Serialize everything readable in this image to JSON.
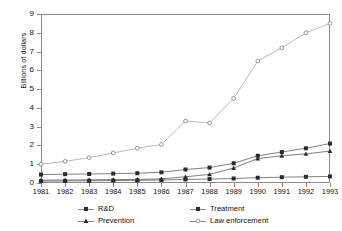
{
  "chart_data": {
    "type": "line",
    "title": "",
    "xlabel": "",
    "ylabel": "Billions of dollars",
    "categories": [
      "1981",
      "1982",
      "1983",
      "1984",
      "1985",
      "1986",
      "1987",
      "1988",
      "1989",
      "1990",
      "1991",
      "1992",
      "1993"
    ],
    "x": [
      1981,
      1982,
      1983,
      1984,
      1985,
      1986,
      1987,
      1988,
      1989,
      1990,
      1991,
      1992,
      1993
    ],
    "xlim": [
      1981,
      1993
    ],
    "ylim": [
      0,
      9
    ],
    "yticks": [
      0,
      1,
      2,
      3,
      4,
      5,
      6,
      7,
      8,
      9
    ],
    "grid": false,
    "legend_position": "bottom",
    "series": [
      {
        "name": "R&D",
        "marker": "square",
        "values": [
          0.1,
          0.11,
          0.12,
          0.13,
          0.14,
          0.16,
          0.19,
          0.21,
          0.24,
          0.28,
          0.31,
          0.33,
          0.35
        ]
      },
      {
        "name": "Treatment",
        "marker": "square",
        "values": [
          0.45,
          0.47,
          0.48,
          0.5,
          0.52,
          0.57,
          0.72,
          0.82,
          1.05,
          1.45,
          1.65,
          1.85,
          2.1
        ]
      },
      {
        "name": "Prevention",
        "marker": "triangle",
        "values": [
          0.15,
          0.16,
          0.17,
          0.18,
          0.19,
          0.22,
          0.33,
          0.46,
          0.8,
          1.3,
          1.45,
          1.55,
          1.7
        ]
      },
      {
        "name": "Law enforcement",
        "marker": "circle",
        "values": [
          1.0,
          1.15,
          1.35,
          1.6,
          1.85,
          2.05,
          3.3,
          3.2,
          4.5,
          6.5,
          7.2,
          8.0,
          8.5
        ]
      }
    ]
  },
  "legend": {
    "items": [
      {
        "label": "R&D"
      },
      {
        "label": "Treatment"
      },
      {
        "label": "Prevention"
      },
      {
        "label": "Law enforcement"
      }
    ]
  },
  "axis": {
    "y_title": "Billions of dollars"
  },
  "colors": {
    "line_dark": "#4a4a4a",
    "line_light": "#9a9a9a",
    "frame": "#8a8a8a",
    "text": "#111111"
  }
}
